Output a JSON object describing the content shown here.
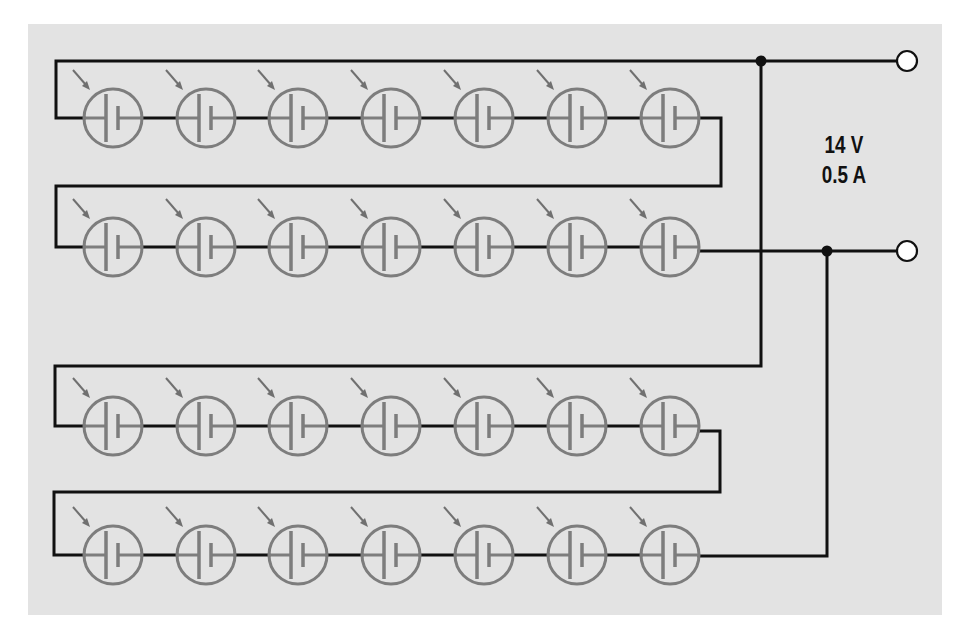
{
  "figure": {
    "type": "solar-cell series-parallel array",
    "rating": {
      "voltage": "14 V",
      "current": "0.5 A"
    },
    "colors": {
      "panel": "#e3e3e3",
      "wire": "#111111",
      "cell": "#7d7d7d"
    },
    "strings": [
      {
        "name": "string-1",
        "rows": [
          1,
          2
        ],
        "cells_per_row": 7
      },
      {
        "name": "string-2",
        "rows": [
          3,
          4
        ],
        "cells_per_row": 7
      }
    ],
    "cell_count": 28,
    "cell_symbol": "photovoltaic-cell-icon",
    "terminals": [
      "positive-terminal",
      "negative-terminal"
    ]
  }
}
